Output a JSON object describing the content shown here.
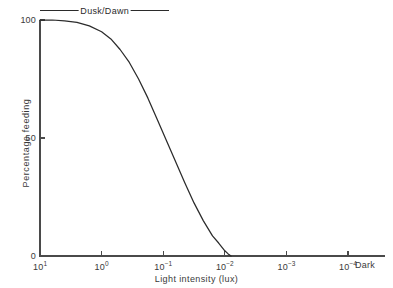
{
  "chart_data": {
    "type": "line",
    "title": "",
    "xlabel": "Light intensity (lux)",
    "ylabel": "Percentage feeding",
    "grid": false,
    "legend_position": "none",
    "x_scale": "log10-descending",
    "x_tick_labels": [
      "10¹",
      "10⁰",
      "10⁻¹",
      "10⁻²",
      "10⁻³",
      "10⁻⁴"
    ],
    "x_tick_mantissas": [
      "10",
      "10",
      "10",
      "10",
      "10",
      "10"
    ],
    "x_tick_exponents": [
      "1",
      "0",
      "-1",
      "-2",
      "-3",
      "-4"
    ],
    "x_tick_log_values": [
      1,
      0,
      -1,
      -2,
      -3,
      -4
    ],
    "x_axis_end_label": "Dark",
    "xlim_log": [
      1,
      -4.6
    ],
    "y_tick_labels": [
      "0",
      "50",
      "100"
    ],
    "y_tick_values": [
      0,
      50,
      100
    ],
    "ylim": [
      0,
      100
    ],
    "series": [
      {
        "name": "Percentage feeding",
        "x_log": [
          1.0,
          0.8,
          0.6,
          0.4,
          0.2,
          0.0,
          -0.15,
          -0.3,
          -0.45,
          -0.6,
          -0.75,
          -0.9,
          -1.05,
          -1.2,
          -1.35,
          -1.5,
          -1.65,
          -1.8,
          -1.9,
          -2.0,
          -2.05,
          -2.1
        ],
        "values": [
          100,
          100,
          99.6,
          99,
          97.5,
          95,
          92,
          87.5,
          82,
          75,
          67,
          58,
          49,
          40,
          31,
          22.5,
          15,
          8.5,
          5.5,
          2.2,
          1.0,
          0
        ]
      }
    ],
    "annotations": [
      {
        "name": "dusk-dawn",
        "text": "Dusk/Dawn",
        "kind": "span-rule-with-label",
        "x_log_start": 1.0,
        "x_log_end": -1.1,
        "y_value": 104
      }
    ]
  }
}
